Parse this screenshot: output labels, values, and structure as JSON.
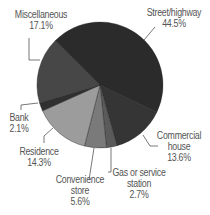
{
  "chart_data": {
    "type": "pie",
    "title": "",
    "start_angle_deg": -45,
    "direction": "clockwise",
    "center": [
      100,
      85
    ],
    "radius": 63,
    "slices": [
      {
        "label": "Street/highway",
        "value": 44.5,
        "display": "44.5%",
        "color": "#2b2b2b"
      },
      {
        "label": "Commercial house",
        "value": 13.6,
        "display": "13.6%",
        "color": "#353535"
      },
      {
        "label": "Gas or service station",
        "value": 2.7,
        "display": "2.7%",
        "color": "#5a5a5a"
      },
      {
        "label": "Convenience store",
        "value": 5.6,
        "display": "5.6%",
        "color": "#7a7a7a"
      },
      {
        "label": "Residence",
        "value": 14.3,
        "display": "14.3%",
        "color": "#9c9c9c"
      },
      {
        "label": "Bank",
        "value": 2.1,
        "display": "2.1%",
        "color": "#303030"
      },
      {
        "label": "Miscellaneous",
        "value": 17.1,
        "display": "17.1%",
        "color": "#474747"
      }
    ],
    "legend": "none (direct labels with leader lines)"
  },
  "labels": {
    "street": {
      "line1": "Street/highway",
      "line2": "44.5%"
    },
    "commercial": {
      "line1": "Commercial",
      "line2": "house",
      "line3": "13.6%"
    },
    "gas": {
      "line1": "Gas or service",
      "line2": "station",
      "line3": "2.7%"
    },
    "convenience": {
      "line1": "Convenience",
      "line2": "store",
      "line3": "5.6%"
    },
    "residence": {
      "line1": "Residence",
      "line2": "14.3%"
    },
    "bank": {
      "line1": "Bank",
      "line2": "2.1%"
    },
    "misc": {
      "line1": "Miscellaneous",
      "line2": "17.1%"
    }
  }
}
